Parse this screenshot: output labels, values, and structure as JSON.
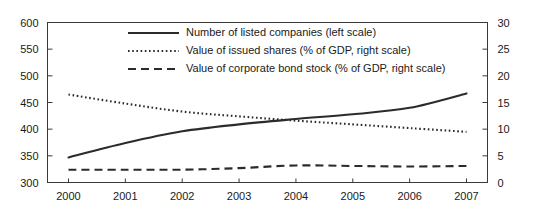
{
  "chart_data": {
    "type": "line",
    "title": "",
    "xlabel": "",
    "ylabel": "",
    "grid": false,
    "legend_position": "top-center",
    "x": [
      2000,
      2001,
      2002,
      2003,
      2004,
      2005,
      2006,
      2007
    ],
    "categories": [
      "2000",
      "2001",
      "2002",
      "2003",
      "2004",
      "2005",
      "2006",
      "2007"
    ],
    "axes": {
      "left": {
        "label": "",
        "ylim": [
          300,
          600
        ],
        "ticks": [
          300,
          350,
          400,
          450,
          500,
          550,
          600
        ],
        "tick_labels": [
          "300",
          "350",
          "400",
          "450",
          "500",
          "550",
          "600"
        ]
      },
      "right": {
        "label": "",
        "ylim": [
          0,
          30
        ],
        "ticks": [
          0,
          5,
          10,
          15,
          20,
          25,
          30
        ],
        "tick_labels": [
          "0",
          "5",
          "10",
          "15",
          "20",
          "25",
          "30"
        ]
      },
      "bottom": {
        "tick_labels": [
          "2000",
          "2001",
          "2002",
          "2003",
          "2004",
          "2005",
          "2006",
          "2007"
        ]
      }
    },
    "series": [
      {
        "name": "Number of listed companies (left scale)",
        "axis": "left",
        "style": "solid",
        "values": [
          347,
          374,
          396,
          409,
          419,
          428,
          440,
          467
        ]
      },
      {
        "name": "Value of issued shares (% of GDP, right scale)",
        "axis": "right",
        "style": "dotted",
        "values": [
          16.5,
          14.8,
          13.3,
          12.4,
          11.6,
          10.9,
          10.2,
          9.5
        ]
      },
      {
        "name": "Value of corporate bond stock  (% of GDP, right scale)",
        "axis": "right",
        "style": "dashed",
        "values": [
          2.4,
          2.4,
          2.4,
          2.7,
          3.2,
          3.1,
          3.0,
          3.1
        ]
      }
    ]
  },
  "legend": {
    "items": [
      {
        "label": "Number of listed companies (left scale)",
        "style": "solid"
      },
      {
        "label": "Value of issued shares (% of GDP, right scale)",
        "style": "dotted"
      },
      {
        "label": "Value of corporate bond stock  (% of GDP, right scale)",
        "style": "dashed"
      }
    ]
  }
}
